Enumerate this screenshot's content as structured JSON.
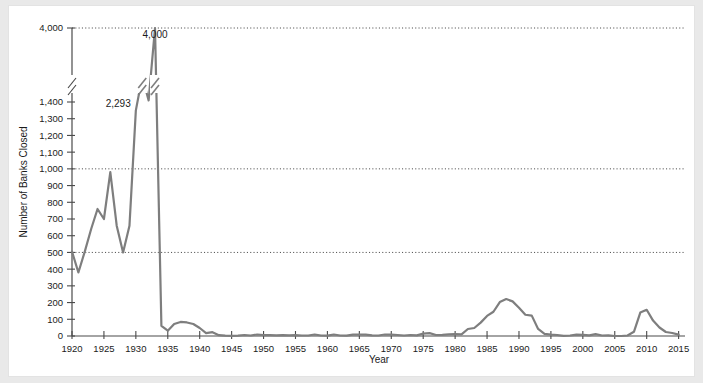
{
  "chart_data": {
    "type": "line",
    "title": "",
    "xlabel": "Year",
    "ylabel": "Number of Banks Closed",
    "xlim": [
      1920,
      2016
    ],
    "ylim": [
      0,
      4000
    ],
    "grid": true,
    "legend": false,
    "axis_break": {
      "low": 1450,
      "high": 3850,
      "note": "y-axis broken between 1,400 and 4,000"
    },
    "line_color": "#7e7e7e",
    "gridline_values": [
      500,
      1000,
      4000
    ],
    "xticks": [
      1920,
      1925,
      1930,
      1935,
      1940,
      1945,
      1950,
      1955,
      1960,
      1965,
      1970,
      1975,
      1980,
      1985,
      1990,
      1995,
      2000,
      2005,
      2010,
      2015
    ],
    "xtick_labels": [
      "1920",
      "1925",
      "1930",
      "1935",
      "1940",
      "1945",
      "1950",
      "1955",
      "1960",
      "1965",
      "1970",
      "1975",
      "1980",
      "1985",
      "1990",
      "1995",
      "2000",
      "2005",
      "2010",
      "2015"
    ],
    "yticks": [
      0,
      100,
      200,
      300,
      400,
      500,
      600,
      700,
      800,
      900,
      1000,
      1100,
      1200,
      1300,
      1400,
      4000
    ],
    "ytick_labels": [
      "0",
      "100",
      "200",
      "300",
      "400",
      "500",
      "600",
      "700",
      "800",
      "900",
      "1,000",
      "1,100",
      "1,200",
      "1,300",
      "1,400",
      "4,000"
    ],
    "annotations": [
      {
        "text": "4,000",
        "x": 1933,
        "y": 4000
      },
      {
        "text": "2,293",
        "x": 1931,
        "y": 2293
      }
    ],
    "x": [
      1920,
      1921,
      1922,
      1923,
      1924,
      1925,
      1926,
      1927,
      1928,
      1929,
      1930,
      1931,
      1932,
      1933,
      1934,
      1935,
      1936,
      1937,
      1938,
      1939,
      1940,
      1941,
      1942,
      1943,
      1944,
      1945,
      1946,
      1947,
      1948,
      1949,
      1950,
      1951,
      1952,
      1953,
      1954,
      1955,
      1956,
      1957,
      1958,
      1959,
      1960,
      1961,
      1962,
      1963,
      1964,
      1965,
      1966,
      1967,
      1968,
      1969,
      1970,
      1971,
      1972,
      1973,
      1974,
      1975,
      1976,
      1977,
      1978,
      1979,
      1980,
      1981,
      1982,
      1983,
      1984,
      1985,
      1986,
      1987,
      1988,
      1989,
      1990,
      1991,
      1992,
      1993,
      1994,
      1995,
      1996,
      1997,
      1998,
      1999,
      2000,
      2001,
      2002,
      2003,
      2004,
      2005,
      2006,
      2007,
      2008,
      2009,
      2010,
      2011,
      2012,
      2013,
      2014,
      2015
    ],
    "values": [
      505,
      380,
      505,
      640,
      760,
      700,
      980,
      660,
      500,
      660,
      1350,
      2293,
      1456,
      4000,
      61,
      32,
      72,
      84,
      81,
      72,
      48,
      17,
      23,
      5,
      2,
      1,
      2,
      6,
      3,
      9,
      5,
      5,
      4,
      5,
      4,
      5,
      3,
      3,
      9,
      3,
      2,
      9,
      3,
      2,
      8,
      9,
      8,
      4,
      3,
      9,
      8,
      6,
      3,
      6,
      4,
      14,
      17,
      6,
      7,
      10,
      11,
      10,
      42,
      48,
      80,
      120,
      145,
      203,
      221,
      207,
      169,
      127,
      122,
      42,
      13,
      8,
      6,
      1,
      3,
      8,
      7,
      4,
      11,
      3,
      4,
      0,
      0,
      3,
      25,
      140,
      157,
      92,
      51,
      24,
      18,
      8
    ],
    "series_name": "Number of Banks Closed"
  },
  "figure": {
    "background": "#ffffff",
    "page_background": "#e9e9e9"
  }
}
